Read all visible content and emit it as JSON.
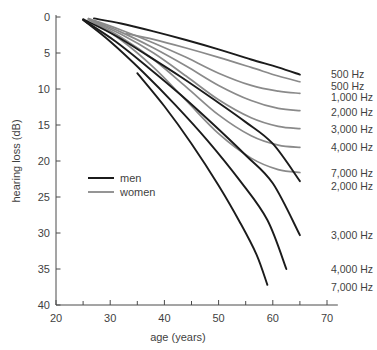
{
  "chart_data": {
    "type": "line",
    "title": "",
    "xlabel": "age (years)",
    "ylabel": "hearing loss (dB)",
    "xlim": [
      20,
      72
    ],
    "ylim": [
      0,
      40
    ],
    "y_axis_inverted": true,
    "grid": false,
    "legend_position": "inner-left",
    "x_ticks_major": [
      20,
      30,
      40,
      50,
      60,
      70
    ],
    "x_ticks_minor": [
      25,
      35,
      45,
      55,
      65
    ],
    "y_ticks_major": [
      0,
      5,
      10,
      15,
      20,
      25,
      30,
      35,
      40
    ],
    "legend": [
      {
        "name": "men",
        "color": "#1b1b1b"
      },
      {
        "name": "women",
        "color": "#8a8a8a"
      }
    ],
    "series": [
      {
        "name": "500 Hz",
        "group": "men",
        "color": "#1b1b1b",
        "end_label": "500 Hz",
        "x": [
          27,
          32,
          38,
          44,
          50,
          56,
          61,
          65
        ],
        "y": [
          0.2,
          0.9,
          2.0,
          3.2,
          4.5,
          5.9,
          7.0,
          8.0
        ]
      },
      {
        "name": "500 Hz",
        "group": "women",
        "color": "#8a8a8a",
        "end_label": "500 Hz",
        "x": [
          33,
          38,
          44,
          50,
          56,
          61,
          65
        ],
        "y": [
          2.3,
          3.1,
          4.3,
          5.6,
          7.0,
          8.2,
          9.0
        ]
      },
      {
        "name": "1,000 Hz",
        "group": "women",
        "color": "#8a8a8a",
        "end_label": "1,000 Hz",
        "x": [
          26,
          32,
          38,
          44,
          50,
          56,
          61,
          65
        ],
        "y": [
          0.2,
          1.8,
          3.6,
          5.6,
          7.8,
          9.5,
          10.3,
          10.6
        ]
      },
      {
        "name": "2,000 Hz",
        "group": "women",
        "color": "#8a8a8a",
        "end_label": "2,000 Hz",
        "x": [
          26,
          32,
          38,
          44,
          50,
          56,
          61,
          65
        ],
        "y": [
          0.3,
          2.1,
          4.3,
          6.8,
          9.5,
          11.6,
          12.7,
          13.0
        ]
      },
      {
        "name": "3,000 Hz",
        "group": "women",
        "color": "#8a8a8a",
        "end_label": "3,000 Hz",
        "x": [
          26,
          32,
          38,
          44,
          50,
          56,
          61,
          65
        ],
        "y": [
          0.3,
          2.4,
          5.0,
          8.2,
          11.5,
          14.0,
          15.2,
          15.5
        ]
      },
      {
        "name": "4,000 Hz",
        "group": "women",
        "color": "#8a8a8a",
        "end_label": "4,000 Hz",
        "x": [
          26,
          32,
          38,
          44,
          50,
          56,
          61,
          65
        ],
        "y": [
          0.3,
          2.8,
          5.9,
          9.7,
          13.6,
          16.5,
          17.8,
          18.1
        ]
      },
      {
        "name": "7,000 Hz",
        "group": "women",
        "color": "#8a8a8a",
        "end_label": "7,000 Hz",
        "x": [
          26,
          32,
          38,
          44,
          50,
          56,
          61,
          65
        ],
        "y": [
          0.3,
          3.2,
          7.0,
          11.6,
          16.2,
          19.6,
          21.2,
          21.6
        ]
      },
      {
        "name": "2,000 Hz",
        "group": "men",
        "color": "#1b1b1b",
        "end_label": "2,000 Hz",
        "x": [
          25,
          31,
          37,
          43,
          49,
          55,
          60,
          65
        ],
        "y": [
          0.3,
          2.6,
          5.4,
          8.3,
          11.4,
          14.6,
          17.6,
          22.8
        ]
      },
      {
        "name": "3,000 Hz",
        "group": "men",
        "color": "#1b1b1b",
        "end_label": "3,000 Hz",
        "x": [
          25,
          31,
          37,
          43,
          49,
          55,
          60,
          65
        ],
        "y": [
          0.4,
          3.4,
          7.0,
          10.8,
          14.9,
          19.2,
          23.1,
          30.3
        ]
      },
      {
        "name": "4,000 Hz",
        "group": "men",
        "color": "#1b1b1b",
        "end_label": "4,000 Hz",
        "x": [
          25,
          30,
          36,
          42,
          48,
          54,
          59,
          62.5
        ],
        "y": [
          0.4,
          3.4,
          7.6,
          12.2,
          17.2,
          22.8,
          28.2,
          35.0
        ]
      },
      {
        "name": "7,000 Hz",
        "group": "men",
        "color": "#1b1b1b",
        "end_label": "7,000 Hz",
        "x": [
          35,
          40,
          45,
          50,
          54,
          57,
          59
        ],
        "y": [
          7.8,
          12.4,
          17.6,
          23.4,
          28.6,
          33.0,
          37.2
        ]
      }
    ],
    "end_labels": [
      {
        "text": "500 Hz",
        "y_value": 8.0
      },
      {
        "text": "500 Hz",
        "y_value": 9.7
      },
      {
        "text": "1,000 Hz",
        "y_value": 11.2
      },
      {
        "text": "2,000 Hz",
        "y_value": 13.2
      },
      {
        "text": "3,000 Hz",
        "y_value": 15.6
      },
      {
        "text": "4,000 Hz",
        "y_value": 18.1
      },
      {
        "text": "7,000 Hz",
        "y_value": 21.8
      },
      {
        "text": "2,000 Hz",
        "y_value": 23.6
      },
      {
        "text": "3,000 Hz",
        "y_value": 30.4
      },
      {
        "text": "4,000 Hz",
        "y_value": 35.1
      },
      {
        "text": "7,000 Hz",
        "y_value": 37.6
      }
    ]
  },
  "watermark": {
    "text": ""
  }
}
